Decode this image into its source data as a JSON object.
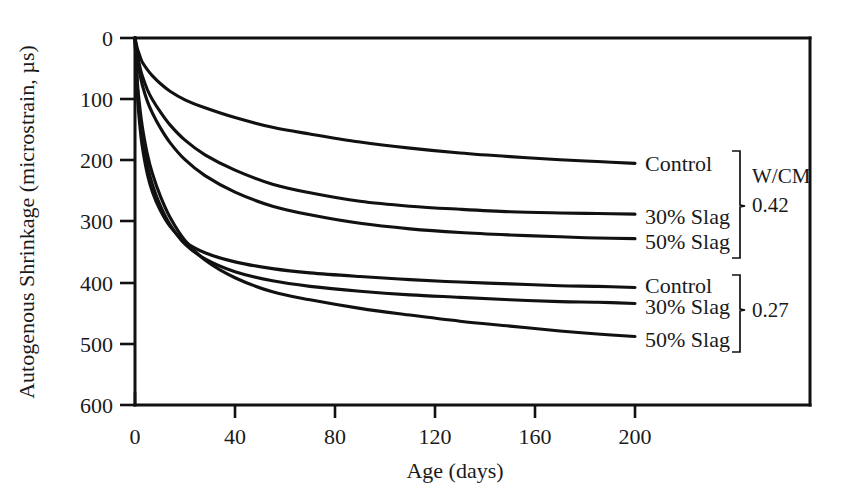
{
  "chart_data": {
    "type": "line",
    "title": "",
    "xlabel": "Age (days)",
    "ylabel": "Autogenous Shrinkage (microstrain, µs)",
    "xlim": [
      0,
      210
    ],
    "ylim": [
      0,
      600
    ],
    "y_inverted": true,
    "grid": false,
    "xticks": [
      "0",
      "40",
      "80",
      "120",
      "160",
      "200"
    ],
    "xtick_values": [
      0,
      40,
      80,
      120,
      160,
      200
    ],
    "yticks": [
      "0",
      "100",
      "200",
      "300",
      "400",
      "500",
      "600"
    ],
    "ytick_values": [
      0,
      100,
      200,
      300,
      400,
      500,
      600
    ],
    "legend_position": "right-inline-at-curve-ends",
    "x": [
      0,
      1,
      2,
      3,
      5,
      7,
      10,
      14,
      20,
      28,
      40,
      55,
      70,
      90,
      110,
      130,
      150,
      170,
      185,
      200
    ],
    "series": [
      {
        "name": "Control",
        "group": "0.42",
        "label": "Control",
        "values": [
          0,
          18,
          30,
          40,
          52,
          62,
          74,
          87,
          101,
          114,
          130,
          146,
          157,
          170,
          180,
          188,
          194,
          199,
          202,
          205
        ]
      },
      {
        "name": "30% Slag",
        "group": "0.42",
        "label": "30% Slag",
        "values": [
          0,
          28,
          48,
          63,
          85,
          101,
          120,
          142,
          167,
          191,
          216,
          239,
          253,
          267,
          275,
          280,
          284,
          286,
          287,
          288
        ]
      },
      {
        "name": "50% Slag",
        "group": "0.42",
        "label": "50% Slag",
        "values": [
          0,
          36,
          60,
          78,
          104,
          123,
          146,
          171,
          199,
          225,
          252,
          275,
          289,
          303,
          312,
          318,
          322,
          325,
          327,
          328
        ]
      },
      {
        "name": "Control",
        "group": "0.27",
        "label": "Control",
        "values": [
          0,
          96,
          146,
          180,
          224,
          252,
          281,
          308,
          333,
          351,
          366,
          377,
          384,
          390,
          395,
          399,
          402,
          405,
          406,
          408
        ]
      },
      {
        "name": "30% Slag",
        "group": "0.27",
        "label": "30% Slag",
        "values": [
          0,
          84,
          131,
          164,
          209,
          240,
          273,
          305,
          337,
          361,
          382,
          397,
          406,
          414,
          420,
          424,
          428,
          431,
          432,
          434
        ]
      },
      {
        "name": "50% Slag",
        "group": "0.27",
        "label": "50% Slag",
        "values": [
          0,
          74,
          116,
          147,
          191,
          222,
          257,
          293,
          331,
          363,
          392,
          415,
          428,
          442,
          453,
          463,
          471,
          479,
          484,
          488
        ]
      }
    ],
    "groups": [
      {
        "name": "W/CM 0.42",
        "header": "W/CM",
        "value": "0.42",
        "members": [
          "Control",
          "30% Slag",
          "50% Slag"
        ]
      },
      {
        "name": "W/CM 0.27",
        "header": "",
        "value": "0.27",
        "members": [
          "Control",
          "30% Slag",
          "50% Slag"
        ]
      }
    ],
    "colors": {
      "line": "#111111",
      "axis": "#111111",
      "background": "#ffffff"
    }
  },
  "labels": {
    "xlabel": "Age (days)",
    "ylabel": "Autogenous Shrinkage (microstrain, µs)",
    "wcm_header": "W/CM",
    "wcm_high": "0.42",
    "wcm_low": "0.27",
    "s0": "Control",
    "s1": "30% Slag",
    "s2": "50% Slag",
    "s3": "Control",
    "s4": "30% Slag",
    "s5": "50% Slag",
    "xt0": "0",
    "xt1": "40",
    "xt2": "80",
    "xt3": "120",
    "xt4": "160",
    "xt5": "200",
    "yt0": "0",
    "yt1": "100",
    "yt2": "200",
    "yt3": "300",
    "yt4": "400",
    "yt5": "500",
    "yt6": "600"
  }
}
